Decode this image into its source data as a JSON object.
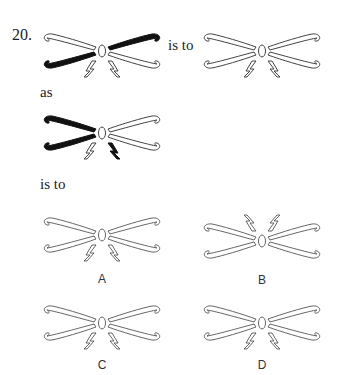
{
  "question": {
    "number": "20.",
    "connector_1": "is to",
    "connector_2": "as",
    "connector_3": "is to"
  },
  "figures": {
    "stem_1": {
      "description": "bow shape; upper-right and lower-left wings filled black; bolts below pointing down",
      "filled": [
        "upper-right",
        "lower-left"
      ],
      "bolts": "down",
      "bolt_filled": "none"
    },
    "stem_2": {
      "description": "bow shape all outlined; bolts below pointing down",
      "filled": [],
      "bolts": "down",
      "bolt_filled": "none"
    },
    "stem_3": {
      "description": "bow shape; upper-left and lower-left wings filled black; right bolt filled black",
      "filled": [
        "upper-left",
        "lower-left"
      ],
      "bolts": "down",
      "bolt_filled": "right"
    }
  },
  "options": [
    {
      "label": "A",
      "bolts": "down"
    },
    {
      "label": "B",
      "bolts": "up"
    },
    {
      "label": "C",
      "bolts": "down"
    },
    {
      "label": "D",
      "bolts": "down"
    }
  ],
  "colors": {
    "ink": "#111111",
    "outline": "#444444",
    "background": "#ffffff"
  }
}
